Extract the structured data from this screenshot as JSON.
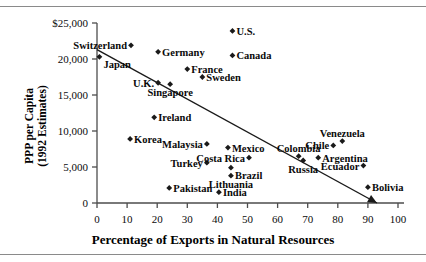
{
  "chart_data": {
    "type": "scatter",
    "title": "",
    "xlabel": "Percentage of Exports in Natural Resources",
    "ylabel": "PPP per Capita\n(1992 Estimates)",
    "ylabel_line1": "PPP per Capita",
    "ylabel_line2": "(1992 Estimates)",
    "xlim": [
      0,
      100
    ],
    "ylim": [
      0,
      25000
    ],
    "xticks": [
      0,
      10,
      20,
      30,
      40,
      50,
      60,
      70,
      80,
      90,
      100
    ],
    "xtick_labels": [
      "0",
      "10",
      "20",
      "30",
      "40",
      "50",
      "60",
      "70",
      "80",
      "90",
      "100"
    ],
    "yticks": [
      0,
      5000,
      10000,
      15000,
      20000,
      25000
    ],
    "ytick_labels": [
      "0",
      "5,000",
      "10,000",
      "15,000",
      "20,000",
      "$25,000"
    ],
    "grid": false,
    "legend": "none",
    "marker": "diamond",
    "marker_color": "#1a1a1a",
    "line_color": "#1a1a1a",
    "axis_color": "#4d4d4d",
    "trendline": {
      "label": "trend-line",
      "arrow": true,
      "x_start": 0,
      "y_start": 21300,
      "x_end": 93,
      "y_end": 0
    },
    "points": [
      {
        "name": "Switzerland",
        "x": 11.3,
        "y": 21900,
        "label_pos": "left"
      },
      {
        "name": "U.S.",
        "x": 45.0,
        "y": 23900,
        "label_pos": "right"
      },
      {
        "name": "Germany",
        "x": 20.3,
        "y": 21000,
        "label_pos": "right"
      },
      {
        "name": "Japan",
        "x": 0.8,
        "y": 20300,
        "label_pos": "below-right"
      },
      {
        "name": "France",
        "x": 30.0,
        "y": 18600,
        "label_pos": "right"
      },
      {
        "name": "Canada",
        "x": 45.0,
        "y": 20500,
        "label_pos": "right"
      },
      {
        "name": "Sweden",
        "x": 35.0,
        "y": 17500,
        "label_pos": "right"
      },
      {
        "name": "U.K.",
        "x": 20.3,
        "y": 16700,
        "label_pos": "left"
      },
      {
        "name": "Singapore",
        "x": 24.3,
        "y": 16500,
        "label_pos": "below-center"
      },
      {
        "name": "Ireland",
        "x": 19.0,
        "y": 11900,
        "label_pos": "right"
      },
      {
        "name": "Korea",
        "x": 11.0,
        "y": 8900,
        "label_pos": "right"
      },
      {
        "name": "Malaysia",
        "x": 36.5,
        "y": 8200,
        "label_pos": "left"
      },
      {
        "name": "Mexico",
        "x": 43.5,
        "y": 7700,
        "label_pos": "right"
      },
      {
        "name": "Colombia",
        "x": 67.0,
        "y": 6500,
        "label_pos": "above-right"
      },
      {
        "name": "Chile",
        "x": 78.5,
        "y": 8000,
        "label_pos": "left"
      },
      {
        "name": "Venezuela",
        "x": 81.5,
        "y": 8600,
        "label_pos": "above-right"
      },
      {
        "name": "Turkey",
        "x": 36.5,
        "y": 5600,
        "label_pos": "left"
      },
      {
        "name": "Costa Rica",
        "x": 50.5,
        "y": 6300,
        "label_pos": "left"
      },
      {
        "name": "Russia",
        "x": 68.5,
        "y": 5900,
        "label_pos": "below-center"
      },
      {
        "name": "Argentina",
        "x": 73.5,
        "y": 6300,
        "label_pos": "right"
      },
      {
        "name": "Ecuador",
        "x": 88.5,
        "y": 5200,
        "label_pos": "left"
      },
      {
        "name": "Brazil",
        "x": 44.5,
        "y": 4900,
        "label_pos": "below-right"
      },
      {
        "name": "Lithuania",
        "x": 44.5,
        "y": 3800,
        "label_pos": "below-center"
      },
      {
        "name": "Pakistan",
        "x": 24.0,
        "y": 2100,
        "label_pos": "right"
      },
      {
        "name": "India",
        "x": 40.5,
        "y": 1500,
        "label_pos": "right"
      },
      {
        "name": "Bolivia",
        "x": 90.0,
        "y": 2200,
        "label_pos": "right"
      }
    ]
  }
}
